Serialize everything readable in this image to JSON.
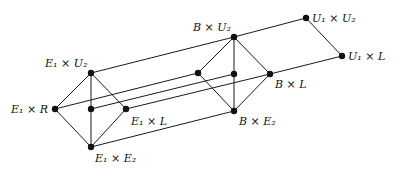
{
  "diagram": {
    "type": "lattice product diagram",
    "nodes": [
      {
        "id": "E1xU2",
        "x": 91,
        "y": 73,
        "label": {
          "base": "E",
          "sub": "1",
          "op": "×",
          "base2": "U",
          "sub2": "2"
        }
      },
      {
        "id": "E1xR",
        "x": 55,
        "y": 109,
        "label": {
          "base": "E",
          "sub": "1",
          "op": "×",
          "base2": "R",
          "sub2": ""
        }
      },
      {
        "id": "E1c",
        "x": 91,
        "y": 109,
        "label": null
      },
      {
        "id": "E1xL",
        "x": 126,
        "y": 109,
        "label": {
          "base": "E",
          "sub": "1",
          "op": "×",
          "base2": "L",
          "sub2": ""
        }
      },
      {
        "id": "E1xE2",
        "x": 91,
        "y": 147,
        "label": {
          "base": "E",
          "sub": "1",
          "op": "×",
          "base2": "E",
          "sub2": "2"
        }
      },
      {
        "id": "BxU2",
        "x": 234,
        "y": 37,
        "label": {
          "base": "B",
          "sub": "",
          "op": "×",
          "base2": "U",
          "sub2": "2"
        }
      },
      {
        "id": "BxR",
        "x": 198,
        "y": 73,
        "label": null
      },
      {
        "id": "Bc",
        "x": 234,
        "y": 74,
        "label": null
      },
      {
        "id": "BxL",
        "x": 270,
        "y": 74,
        "label": {
          "base": "B",
          "sub": "",
          "op": "×",
          "base2": "L",
          "sub2": ""
        }
      },
      {
        "id": "BxE2",
        "x": 234,
        "y": 111,
        "label": {
          "base": "B",
          "sub": "",
          "op": "×",
          "base2": "E",
          "sub2": "2"
        }
      },
      {
        "id": "U1xU2",
        "x": 306,
        "y": 18,
        "label": {
          "base": "U",
          "sub": "1",
          "op": "×",
          "base2": "U",
          "sub2": "2"
        }
      },
      {
        "id": "U1xL",
        "x": 342,
        "y": 56,
        "label": {
          "base": "U",
          "sub": "1",
          "op": "×",
          "base2": "L",
          "sub2": ""
        }
      }
    ],
    "labels": {
      "E1xU2": "E₁ × U₂",
      "E1xR": "E₁ × R",
      "E1xL": "E₁ × L",
      "E1xE2": "E₁ × E₂",
      "BxU2": "B × U₂",
      "BxL": "B × L",
      "BxE2": "B × E₂",
      "U1xU2": "U₁ × U₂",
      "U1xL": "U₁ × L"
    },
    "edges": [
      [
        "E1xU2",
        "E1xR"
      ],
      [
        "E1xU2",
        "E1xL"
      ],
      [
        "E1xU2",
        "E1xE2"
      ],
      [
        "E1xR",
        "E1xE2"
      ],
      [
        "E1xL",
        "E1xE2"
      ],
      [
        "BxU2",
        "BxR"
      ],
      [
        "BxU2",
        "BxL"
      ],
      [
        "BxU2",
        "BxE2"
      ],
      [
        "BxR",
        "BxE2"
      ],
      [
        "BxL",
        "BxE2"
      ],
      [
        "E1xU2",
        "BxU2"
      ],
      [
        "E1xR",
        "BxR"
      ],
      [
        "E1c",
        "Bc"
      ],
      [
        "E1xL",
        "BxL"
      ],
      [
        "E1xE2",
        "BxE2"
      ],
      [
        "BxU2",
        "U1xU2"
      ],
      [
        "BxL",
        "U1xL"
      ],
      [
        "U1xU2",
        "U1xL"
      ]
    ]
  }
}
